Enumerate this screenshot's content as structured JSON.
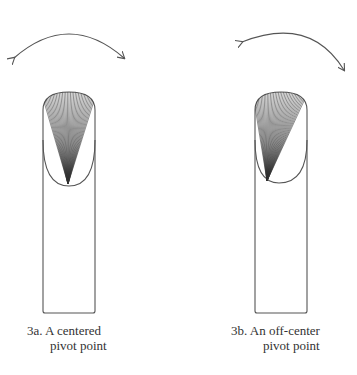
{
  "figures": [
    {
      "id": "3a",
      "caption_line1": "3a.  A centered",
      "caption_line2": "pivot point",
      "pivot": "centered"
    },
    {
      "id": "3b",
      "caption_line1": "3b.  An off-center",
      "caption_line2": "pivot point",
      "pivot": "off-center"
    }
  ],
  "colors": {
    "stroke": "#555555",
    "fan": "#333333",
    "background": "#ffffff"
  }
}
